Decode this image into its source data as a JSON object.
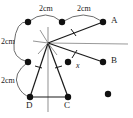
{
  "figure": {
    "type": "geometry-diagram",
    "background": "#ffffff",
    "ink_color": "#1a1a1a",
    "guide_color": "#8c8c8c"
  },
  "labels": {
    "point_a": "A",
    "point_b": "B",
    "point_c": "C",
    "point_d": "D",
    "angle_x": "x"
  },
  "dimensions": [
    {
      "id": "dim_top_left",
      "text": "2cm"
    },
    {
      "id": "dim_top_right",
      "text": "2cm"
    },
    {
      "id": "dim_left_upper",
      "text": "2cm"
    },
    {
      "id": "dim_left_lower",
      "text": "2cm"
    }
  ],
  "points": [
    {
      "id": "p_top_left",
      "x": 28,
      "y": 22,
      "label": ""
    },
    {
      "id": "p_top_mid",
      "x": 62,
      "y": 22,
      "label": ""
    },
    {
      "id": "p_a",
      "x": 103,
      "y": 22,
      "label": "A"
    },
    {
      "id": "p_center",
      "x": 48,
      "y": 43,
      "label": ""
    },
    {
      "id": "p_left_mid",
      "x": 28,
      "y": 62,
      "label": ""
    },
    {
      "id": "p_inner_right",
      "x": 68,
      "y": 62,
      "label": ""
    },
    {
      "id": "p_b",
      "x": 103,
      "y": 62,
      "label": "B"
    },
    {
      "id": "p_d",
      "x": 30,
      "y": 97,
      "label": "D"
    },
    {
      "id": "p_c",
      "x": 68,
      "y": 97,
      "label": "C"
    },
    {
      "id": "p_bottom_right",
      "x": 108,
      "y": 94,
      "label": ""
    }
  ],
  "segments": [
    {
      "id": "seg_center_a",
      "ticks": 1
    },
    {
      "id": "seg_center_b",
      "ticks": 1
    },
    {
      "id": "seg_center_d",
      "ticks": 1
    },
    {
      "id": "seg_center_c",
      "ticks": 1
    },
    {
      "id": "seg_d_c",
      "ticks": 0
    }
  ],
  "guides": [
    {
      "id": "guide_horizontal"
    },
    {
      "id": "guide_vertical"
    }
  ]
}
